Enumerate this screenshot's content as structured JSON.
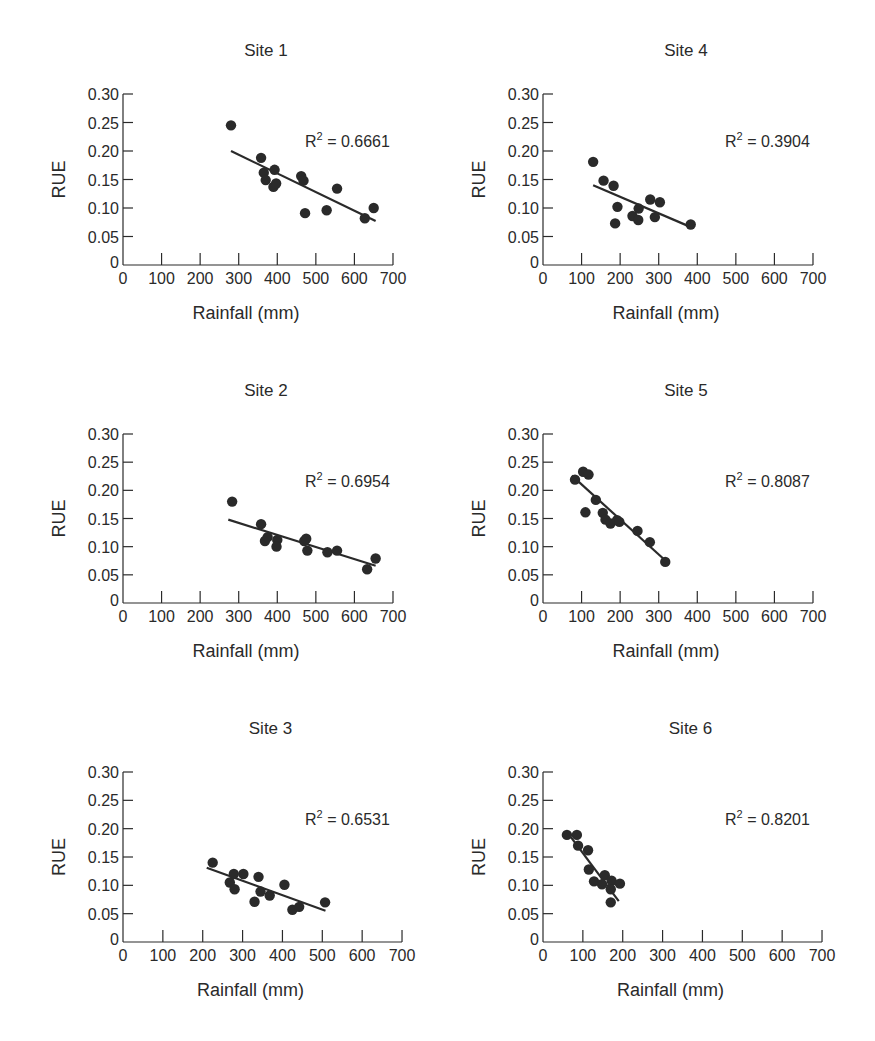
{
  "figure": {
    "xlabel": "Rainfall (mm)",
    "ylabel": "RUE",
    "ink_color": "#2a2a2a",
    "background": "#ffffff"
  },
  "chart_data": [
    {
      "type": "scatter",
      "title": "Site 1",
      "xlabel": "Rainfall (mm)",
      "ylabel": "RUE",
      "xlim": [
        0,
        700
      ],
      "ylim": [
        0,
        0.3
      ],
      "xticks": [
        0,
        100,
        200,
        300,
        400,
        500,
        600,
        700
      ],
      "yticks": [
        "0",
        "0.05",
        "0.10",
        "0.15",
        "0.20",
        "0.25",
        "0.30"
      ],
      "annotation": "R² = 0.6661",
      "r2": 0.6661,
      "points": [
        [
          280,
          0.245
        ],
        [
          358,
          0.188
        ],
        [
          365,
          0.162
        ],
        [
          370,
          0.149
        ],
        [
          393,
          0.167
        ],
        [
          390,
          0.137
        ],
        [
          397,
          0.143
        ],
        [
          462,
          0.156
        ],
        [
          468,
          0.148
        ],
        [
          472,
          0.091
        ],
        [
          528,
          0.096
        ],
        [
          555,
          0.134
        ],
        [
          627,
          0.082
        ],
        [
          650,
          0.1
        ]
      ],
      "trendline": [
        [
          280,
          0.2
        ],
        [
          655,
          0.077
        ]
      ]
    },
    {
      "type": "scatter",
      "title": "Site 2",
      "xlabel": "Rainfall (mm)",
      "ylabel": "RUE",
      "xlim": [
        0,
        700
      ],
      "ylim": [
        0,
        0.3
      ],
      "xticks": [
        0,
        100,
        200,
        300,
        400,
        500,
        600,
        700
      ],
      "yticks": [
        "0",
        "0.05",
        "0.10",
        "0.15",
        "0.20",
        "0.25",
        "0.30"
      ],
      "annotation": "R² = 0.6954",
      "r2": 0.6954,
      "points": [
        [
          283,
          0.18
        ],
        [
          358,
          0.14
        ],
        [
          368,
          0.11
        ],
        [
          375,
          0.117
        ],
        [
          400,
          0.112
        ],
        [
          398,
          0.1
        ],
        [
          470,
          0.11
        ],
        [
          475,
          0.114
        ],
        [
          478,
          0.093
        ],
        [
          530,
          0.09
        ],
        [
          555,
          0.093
        ],
        [
          633,
          0.06
        ],
        [
          655,
          0.079
        ]
      ],
      "trendline": [
        [
          273,
          0.148
        ],
        [
          655,
          0.066
        ]
      ]
    },
    {
      "type": "scatter",
      "title": "Site 3",
      "xlabel": "Rainfall (mm)",
      "ylabel": "RUE",
      "xlim": [
        0,
        700
      ],
      "ylim": [
        0,
        0.3
      ],
      "xticks": [
        0,
        100,
        200,
        300,
        400,
        500,
        600,
        700
      ],
      "yticks": [
        "0",
        "0.05",
        "0.10",
        "0.15",
        "0.20",
        "0.25",
        "0.30"
      ],
      "annotation": "R² = 0.6531",
      "r2": 0.6531,
      "points": [
        [
          225,
          0.14
        ],
        [
          268,
          0.105
        ],
        [
          278,
          0.12
        ],
        [
          280,
          0.093
        ],
        [
          302,
          0.12
        ],
        [
          330,
          0.071
        ],
        [
          340,
          0.115
        ],
        [
          345,
          0.089
        ],
        [
          368,
          0.082
        ],
        [
          405,
          0.101
        ],
        [
          425,
          0.057
        ],
        [
          442,
          0.062
        ],
        [
          507,
          0.07
        ]
      ],
      "trendline": [
        [
          210,
          0.131
        ],
        [
          508,
          0.055
        ]
      ]
    },
    {
      "type": "scatter",
      "title": "Site 4",
      "xlabel": "Rainfall (mm)",
      "ylabel": "RUE",
      "xlim": [
        0,
        700
      ],
      "ylim": [
        0,
        0.3
      ],
      "xticks": [
        0,
        100,
        200,
        300,
        400,
        500,
        600,
        700
      ],
      "yticks": [
        "0",
        "0.05",
        "0.10",
        "0.15",
        "0.20",
        "0.25",
        "0.30"
      ],
      "annotation": "R² = 0.3904",
      "r2": 0.3904,
      "points": [
        [
          130,
          0.181
        ],
        [
          157,
          0.148
        ],
        [
          183,
          0.139
        ],
        [
          187,
          0.073
        ],
        [
          193,
          0.102
        ],
        [
          232,
          0.086
        ],
        [
          247,
          0.079
        ],
        [
          248,
          0.099
        ],
        [
          278,
          0.115
        ],
        [
          290,
          0.084
        ],
        [
          303,
          0.11
        ],
        [
          383,
          0.071
        ]
      ],
      "trendline": [
        [
          130,
          0.14
        ],
        [
          385,
          0.066
        ]
      ]
    },
    {
      "type": "scatter",
      "title": "Site 5",
      "xlabel": "Rainfall (mm)",
      "ylabel": "RUE",
      "xlim": [
        0,
        700
      ],
      "ylim": [
        0,
        0.3
      ],
      "xticks": [
        0,
        100,
        200,
        300,
        400,
        500,
        600,
        700
      ],
      "yticks": [
        "0",
        "0.05",
        "0.10",
        "0.15",
        "0.20",
        "0.25",
        "0.30"
      ],
      "annotation": "R² = 0.8087",
      "r2": 0.8087,
      "points": [
        [
          83,
          0.219
        ],
        [
          104,
          0.233
        ],
        [
          118,
          0.228
        ],
        [
          110,
          0.161
        ],
        [
          137,
          0.183
        ],
        [
          155,
          0.16
        ],
        [
          162,
          0.148
        ],
        [
          175,
          0.141
        ],
        [
          192,
          0.147
        ],
        [
          198,
          0.144
        ],
        [
          245,
          0.128
        ],
        [
          277,
          0.108
        ],
        [
          317,
          0.073
        ]
      ],
      "trendline": [
        [
          75,
          0.226
        ],
        [
          318,
          0.075
        ]
      ]
    },
    {
      "type": "scatter",
      "title": "Site 6",
      "xlabel": "Rainfall (mm)",
      "ylabel": "RUE",
      "xlim": [
        0,
        700
      ],
      "ylim": [
        0,
        0.3
      ],
      "xticks": [
        0,
        100,
        200,
        300,
        400,
        500,
        600,
        700
      ],
      "yticks": [
        "0",
        "0.05",
        "0.10",
        "0.15",
        "0.20",
        "0.25",
        "0.30"
      ],
      "annotation": "R² = 0.8201",
      "r2": 0.8201,
      "points": [
        [
          60,
          0.189
        ],
        [
          85,
          0.189
        ],
        [
          88,
          0.17
        ],
        [
          113,
          0.162
        ],
        [
          115,
          0.128
        ],
        [
          128,
          0.107
        ],
        [
          148,
          0.102
        ],
        [
          155,
          0.118
        ],
        [
          172,
          0.108
        ],
        [
          170,
          0.093
        ],
        [
          170,
          0.07
        ],
        [
          193,
          0.103
        ]
      ],
      "trendline": [
        [
          70,
          0.185
        ],
        [
          190,
          0.072
        ]
      ]
    }
  ],
  "layout": {
    "panels": [
      {
        "index": 0,
        "left": 123,
        "bottom": 265,
        "xscale": 0.3857,
        "top": 94
      },
      {
        "index": 1,
        "left": 123,
        "bottom": 603,
        "xscale": 0.3857,
        "top": 434
      },
      {
        "index": 2,
        "left": 123,
        "bottom": 942,
        "xscale": 0.3986,
        "top": 772
      },
      {
        "index": 3,
        "left": 543,
        "bottom": 265,
        "xscale": 0.3857,
        "top": 94
      },
      {
        "index": 4,
        "left": 543,
        "bottom": 603,
        "xscale": 0.3857,
        "top": 434
      },
      {
        "index": 5,
        "left": 543,
        "bottom": 942,
        "xscale": 0.3986,
        "top": 772
      }
    ]
  }
}
